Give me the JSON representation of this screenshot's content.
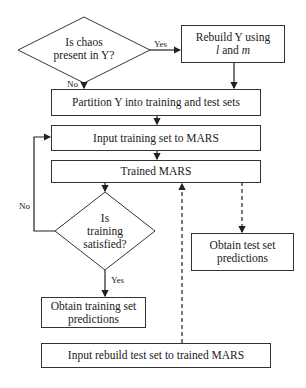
{
  "diagram": {
    "decision_chaos": {
      "line1": "Is chaos",
      "line2": "present in Y?"
    },
    "rebuild": {
      "line1": "Rebuild Y using",
      "var_l": "l",
      "and": " and ",
      "var_m": "m"
    },
    "partition": {
      "label": "Partition Y into training and test sets"
    },
    "input_training": {
      "label": "Input training set to MARS"
    },
    "trained_mars": {
      "label": "Trained MARS"
    },
    "decision_training": {
      "line1": "Is",
      "line2": "training",
      "line3": "satisfied?"
    },
    "obtain_training": {
      "line1": "Obtain training set",
      "line2": "predictions"
    },
    "obtain_test": {
      "line1": "Obtain test set",
      "line2": "predictions"
    },
    "input_rebuild": {
      "label": "Input rebuild test set to trained MARS"
    },
    "edge_labels": {
      "yes_chaos": "Yes",
      "no_chaos": "No",
      "no_training": "No",
      "yes_training": "Yes"
    }
  }
}
